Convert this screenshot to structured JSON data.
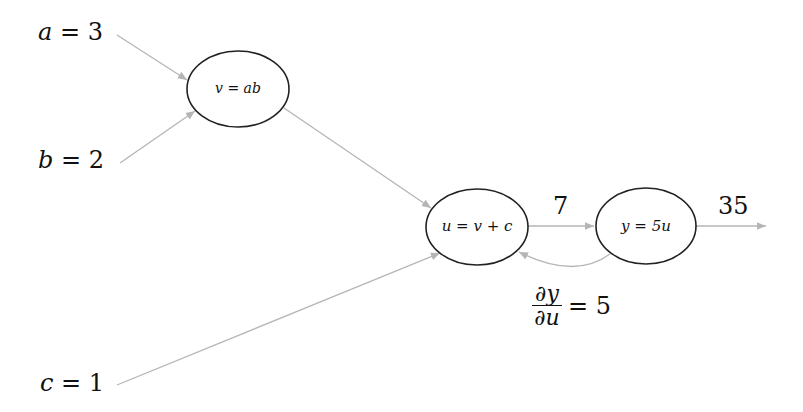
{
  "inputs": {
    "a": {
      "var": "a",
      "op": "=",
      "value": "3"
    },
    "b": {
      "var": "b",
      "op": "=",
      "value": "2"
    },
    "c": {
      "var": "c",
      "op": "=",
      "value": "1"
    }
  },
  "nodes": {
    "v": {
      "label": "v = ab"
    },
    "u": {
      "label": "u = v + c"
    },
    "y": {
      "label": "y = 5u"
    }
  },
  "edge_values": {
    "u_to_y": "7",
    "y_out": "35"
  },
  "gradient": {
    "numerator": "∂y",
    "denominator": "∂u",
    "equals": "= 5"
  },
  "colors": {
    "edge": "#b5b5b5",
    "node_stroke": "#222222",
    "text": "#111111"
  }
}
